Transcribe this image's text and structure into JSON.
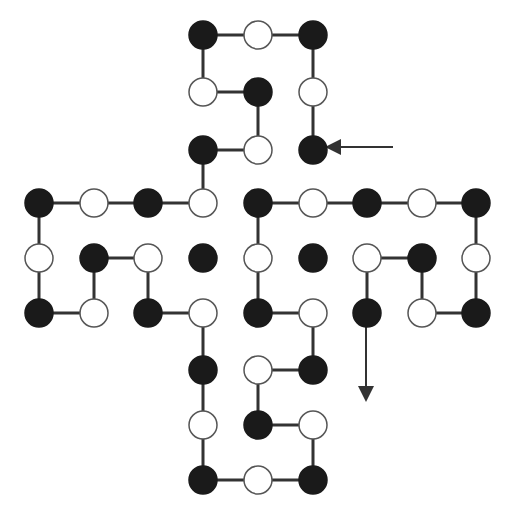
{
  "diagram": {
    "title": "",
    "kind": "cross-shaped grid path of black and white beads",
    "colors": {
      "black": "#1a1a1a",
      "white": "#ffffff",
      "line": "#333333",
      "stroke": "#555555"
    },
    "radius": 14,
    "nodes": [
      {
        "x": 203,
        "y": 35,
        "c": "B"
      },
      {
        "x": 258,
        "y": 35,
        "c": "W"
      },
      {
        "x": 313,
        "y": 35,
        "c": "B"
      },
      {
        "x": 203,
        "y": 92,
        "c": "W"
      },
      {
        "x": 258,
        "y": 92,
        "c": "B"
      },
      {
        "x": 313,
        "y": 92,
        "c": "W"
      },
      {
        "x": 203,
        "y": 150,
        "c": "B"
      },
      {
        "x": 258,
        "y": 150,
        "c": "W"
      },
      {
        "x": 313,
        "y": 150,
        "c": "B"
      },
      {
        "x": 39,
        "y": 203,
        "c": "B"
      },
      {
        "x": 94,
        "y": 203,
        "c": "W"
      },
      {
        "x": 148,
        "y": 203,
        "c": "B"
      },
      {
        "x": 203,
        "y": 203,
        "c": "W"
      },
      {
        "x": 39,
        "y": 258,
        "c": "W"
      },
      {
        "x": 94,
        "y": 258,
        "c": "B"
      },
      {
        "x": 148,
        "y": 258,
        "c": "W"
      },
      {
        "x": 203,
        "y": 258,
        "c": "B"
      },
      {
        "x": 39,
        "y": 313,
        "c": "B"
      },
      {
        "x": 94,
        "y": 313,
        "c": "W"
      },
      {
        "x": 148,
        "y": 313,
        "c": "B"
      },
      {
        "x": 203,
        "y": 313,
        "c": "W"
      },
      {
        "x": 258,
        "y": 203,
        "c": "B"
      },
      {
        "x": 313,
        "y": 203,
        "c": "W"
      },
      {
        "x": 367,
        "y": 203,
        "c": "B"
      },
      {
        "x": 422,
        "y": 203,
        "c": "W"
      },
      {
        "x": 476,
        "y": 203,
        "c": "B"
      },
      {
        "x": 258,
        "y": 258,
        "c": "W"
      },
      {
        "x": 313,
        "y": 258,
        "c": "B"
      },
      {
        "x": 367,
        "y": 258,
        "c": "W"
      },
      {
        "x": 422,
        "y": 258,
        "c": "B"
      },
      {
        "x": 476,
        "y": 258,
        "c": "W"
      },
      {
        "x": 258,
        "y": 313,
        "c": "B"
      },
      {
        "x": 313,
        "y": 313,
        "c": "W"
      },
      {
        "x": 367,
        "y": 313,
        "c": "B"
      },
      {
        "x": 422,
        "y": 313,
        "c": "W"
      },
      {
        "x": 476,
        "y": 313,
        "c": "B"
      },
      {
        "x": 203,
        "y": 370,
        "c": "B"
      },
      {
        "x": 258,
        "y": 370,
        "c": "W"
      },
      {
        "x": 313,
        "y": 370,
        "c": "B"
      },
      {
        "x": 203,
        "y": 425,
        "c": "W"
      },
      {
        "x": 258,
        "y": 425,
        "c": "B"
      },
      {
        "x": 313,
        "y": 425,
        "c": "W"
      },
      {
        "x": 203,
        "y": 480,
        "c": "B"
      },
      {
        "x": 258,
        "y": 480,
        "c": "W"
      },
      {
        "x": 313,
        "y": 480,
        "c": "B"
      }
    ],
    "path": [
      [
        313,
        150
      ],
      [
        313,
        92
      ],
      [
        313,
        35
      ],
      [
        258,
        35
      ],
      [
        203,
        35
      ],
      [
        203,
        92
      ],
      [
        258,
        92
      ],
      [
        258,
        150
      ],
      [
        203,
        150
      ],
      [
        203,
        203
      ],
      [
        148,
        203
      ],
      [
        94,
        203
      ],
      [
        39,
        203
      ],
      [
        39,
        258
      ],
      [
        39,
        313
      ],
      [
        94,
        313
      ],
      [
        94,
        258
      ],
      [
        148,
        258
      ],
      [
        148,
        313
      ],
      [
        203,
        313
      ],
      [
        203,
        370
      ],
      [
        203,
        425
      ],
      [
        203,
        480
      ],
      [
        258,
        480
      ],
      [
        313,
        480
      ],
      [
        313,
        425
      ],
      [
        258,
        425
      ],
      [
        258,
        370
      ],
      [
        313,
        370
      ],
      [
        313,
        313
      ],
      [
        258,
        313
      ],
      [
        258,
        258
      ],
      [
        258,
        203
      ],
      [
        313,
        203
      ],
      [
        367,
        203
      ],
      [
        422,
        203
      ],
      [
        476,
        203
      ],
      [
        476,
        258
      ],
      [
        476,
        313
      ],
      [
        422,
        313
      ],
      [
        422,
        258
      ],
      [
        367,
        258
      ],
      [
        367,
        313
      ]
    ],
    "start_arrow": {
      "from": [
        393,
        147
      ],
      "to": [
        329,
        147
      ],
      "label": "start"
    },
    "end_arrow": {
      "from": [
        366,
        327
      ],
      "to": [
        366,
        398
      ],
      "label": "end"
    }
  }
}
